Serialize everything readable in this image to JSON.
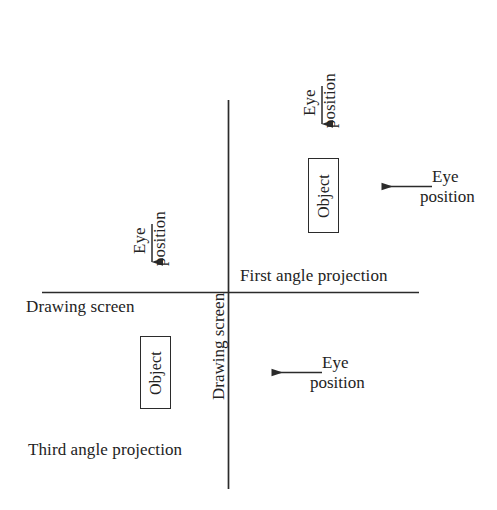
{
  "diagram": {
    "background_color": "#ffffff",
    "line_color": "#2b2b2b",
    "text_color": "#232323",
    "axes": {
      "vertical_label": "Drawing screen",
      "horizontal_label": "Drawing screen"
    },
    "quadrant_labels": {
      "first": "First angle projection",
      "third": "Third angle projection"
    },
    "objects": [
      {
        "id": "object-first-quadrant",
        "label": "Object"
      },
      {
        "id": "object-third-quadrant",
        "label": "Object"
      }
    ],
    "eye_positions": [
      {
        "id": "eye-top-down",
        "line_top": "Eye",
        "line_bottom": "position",
        "direction": "down",
        "orientation": "rotated"
      },
      {
        "id": "eye-right-left",
        "line_top": "Eye",
        "line_bottom": "position",
        "direction": "left",
        "orientation": "horizontal"
      },
      {
        "id": "eye-upper-left-down",
        "line_top": "Eye",
        "line_bottom": "position",
        "direction": "down",
        "orientation": "rotated"
      },
      {
        "id": "eye-lower-right-left",
        "line_top": "Eye",
        "line_bottom": "position",
        "direction": "left",
        "orientation": "horizontal"
      }
    ]
  }
}
